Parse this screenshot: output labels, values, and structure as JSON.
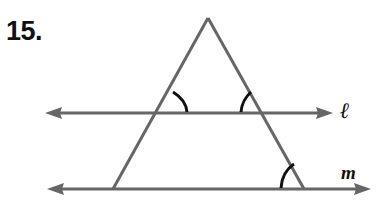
{
  "problem": {
    "number": "15."
  },
  "figure": {
    "lines": [
      {
        "name": "l",
        "label": "ℓ"
      },
      {
        "name": "m",
        "label": "m"
      }
    ],
    "marked_angles": 3,
    "colors": {
      "line": "#666666",
      "arc": "#111111",
      "text": "#111111"
    }
  }
}
